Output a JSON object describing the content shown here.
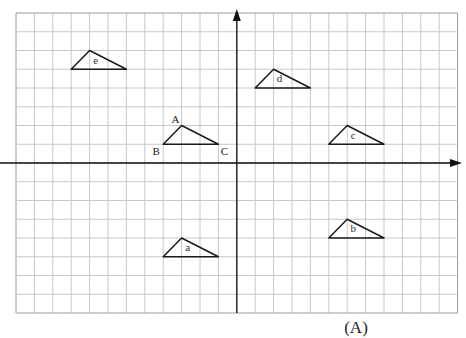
{
  "figure": {
    "caption": "(A)",
    "grid": {
      "origin_px": [
        16,
        13
      ],
      "col_spacing_px": 18.4,
      "row_spacing_px": 18.75,
      "cols": 24,
      "rows": 16,
      "line_color": "#c8c8c8",
      "border_color": "#9a9a9a"
    },
    "axes": {
      "x_axis_row": 8,
      "y_axis_col": 12,
      "color": "#111111",
      "arrows": [
        "right",
        "up"
      ]
    },
    "triangles": [
      {
        "name": "ABC",
        "label": "",
        "vertices": [
          [
            8,
            7
          ],
          [
            9,
            6
          ],
          [
            11,
            7
          ]
        ],
        "vertex_labels": [
          {
            "text": "B",
            "at": [
              8,
              7
            ],
            "dx": -7,
            "dy": 11
          },
          {
            "text": "A",
            "at": [
              9,
              6
            ],
            "dx": -6,
            "dy": -3
          },
          {
            "text": "C",
            "at": [
              11,
              7
            ],
            "dx": 6,
            "dy": 11
          }
        ]
      },
      {
        "name": "e",
        "label": "e",
        "vertices": [
          [
            3,
            3
          ],
          [
            4,
            2
          ],
          [
            6,
            3
          ]
        ]
      },
      {
        "name": "d",
        "label": "d",
        "vertices": [
          [
            13,
            4
          ],
          [
            14,
            3
          ],
          [
            16,
            4
          ]
        ]
      },
      {
        "name": "c",
        "label": "c",
        "vertices": [
          [
            17,
            7
          ],
          [
            18,
            6
          ],
          [
            20,
            7
          ]
        ]
      },
      {
        "name": "b",
        "label": "b",
        "vertices": [
          [
            17,
            12
          ],
          [
            18,
            11
          ],
          [
            20,
            12
          ]
        ]
      },
      {
        "name": "a",
        "label": "a",
        "vertices": [
          [
            8,
            13
          ],
          [
            9,
            12
          ],
          [
            11,
            13
          ]
        ]
      }
    ]
  }
}
